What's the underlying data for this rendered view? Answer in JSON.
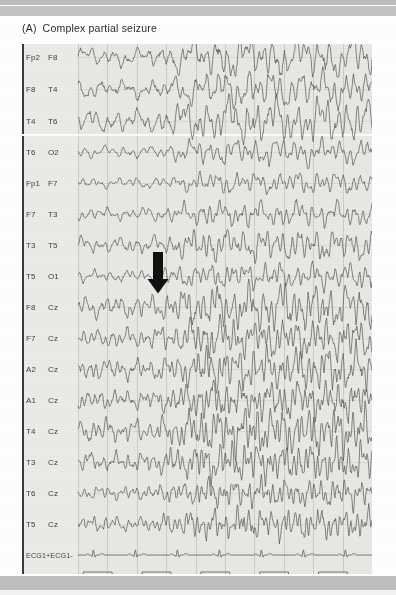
{
  "figure": {
    "panel_tag": "(A)",
    "title": "Complex partial seizure",
    "full_caption": "(A)  Complex partial seizure"
  },
  "annotation": {
    "arrow": {
      "name": "seizure-onset-arrow",
      "direction": "down",
      "color": "#111111",
      "x": 147,
      "y": 252,
      "points_at_channel": "T5 O1 / F8 Cz"
    }
  },
  "colors": {
    "plot_background": "#e9e7e4",
    "trace": "#4a4a4a",
    "axis": "#3a3a3a",
    "gridline": "#8c8c8c",
    "page_background": "#fefefe",
    "scan_band": "#bfbfbf",
    "arrow": "#111111"
  },
  "chart_data": {
    "type": "line",
    "xlabel": "",
    "ylabel": "",
    "grid": true,
    "legend": "none",
    "x": {
      "label": "time",
      "gridline_count": 10,
      "range_note": "continuous EEG epoch"
    },
    "channel_count": 18,
    "categories": [
      "Fp2 F8",
      "F8 T4",
      "T4 T6",
      "T6 O2",
      "Fp1 F7",
      "F7 T3",
      "T3 T5",
      "T5 O1",
      "F8 Cz",
      "F7 Cz",
      "A2 Cz",
      "A1 Cz",
      "T4 Cz",
      "T3 Cz",
      "T6 Cz",
      "T5 Cz",
      "ECG1+ ECG1-",
      "MKR+ MKR-"
    ],
    "series": [
      {
        "name": "Fp2 F8",
        "electrode_1": "Fp2",
        "electrode_2": "F8",
        "kind": "eeg",
        "row": 0,
        "baseline_y": 57,
        "amplitude": 11
      },
      {
        "name": "F8 T4",
        "electrode_1": "F8",
        "electrode_2": "T4",
        "kind": "eeg",
        "row": 1,
        "baseline_y": 89,
        "amplitude": 10
      },
      {
        "name": "T4 T6",
        "electrode_1": "T4",
        "electrode_2": "T6",
        "kind": "eeg",
        "row": 2,
        "baseline_y": 121,
        "amplitude": 12
      },
      {
        "name": "T6 O2",
        "electrode_1": "T6",
        "electrode_2": "O2",
        "kind": "eeg",
        "row": 3,
        "baseline_y": 152,
        "amplitude": 7
      },
      {
        "name": "Fp1 F7",
        "electrode_1": "Fp1",
        "electrode_2": "F7",
        "kind": "eeg",
        "row": 4,
        "baseline_y": 183,
        "amplitude": 6
      },
      {
        "name": "F7 T3",
        "electrode_1": "F7",
        "electrode_2": "T3",
        "kind": "eeg",
        "row": 5,
        "baseline_y": 214,
        "amplitude": 7
      },
      {
        "name": "T3 T5",
        "electrode_1": "T3",
        "electrode_2": "T5",
        "kind": "eeg",
        "row": 6,
        "baseline_y": 245,
        "amplitude": 9
      },
      {
        "name": "T5 O1",
        "electrode_1": "T5",
        "electrode_2": "O1",
        "kind": "eeg",
        "row": 7,
        "baseline_y": 276,
        "amplitude": 7
      },
      {
        "name": "F8 Cz",
        "electrode_1": "F8",
        "electrode_2": "Cz",
        "kind": "eeg",
        "row": 8,
        "baseline_y": 307,
        "amplitude": 13
      },
      {
        "name": "F7 Cz",
        "electrode_1": "F7",
        "electrode_2": "Cz",
        "kind": "eeg",
        "row": 9,
        "baseline_y": 338,
        "amplitude": 11
      },
      {
        "name": "A2 Cz",
        "electrode_1": "A2",
        "electrode_2": "Cz",
        "kind": "eeg",
        "row": 10,
        "baseline_y": 369,
        "amplitude": 12
      },
      {
        "name": "A1 Cz",
        "electrode_1": "A1",
        "electrode_2": "Cz",
        "kind": "eeg",
        "row": 11,
        "baseline_y": 400,
        "amplitude": 11
      },
      {
        "name": "T4 Cz",
        "electrode_1": "T4",
        "electrode_2": "Cz",
        "kind": "eeg",
        "row": 12,
        "baseline_y": 431,
        "amplitude": 13
      },
      {
        "name": "T3 Cz",
        "electrode_1": "T3",
        "electrode_2": "Cz",
        "kind": "eeg",
        "row": 13,
        "baseline_y": 462,
        "amplitude": 11
      },
      {
        "name": "T6 Cz",
        "electrode_1": "T6",
        "electrode_2": "Cz",
        "kind": "eeg",
        "row": 14,
        "baseline_y": 493,
        "amplitude": 8
      },
      {
        "name": "T5 Cz",
        "electrode_1": "T5",
        "electrode_2": "Cz",
        "kind": "eeg",
        "row": 15,
        "baseline_y": 524,
        "amplitude": 9
      },
      {
        "name": "ECG1+ ECG1-",
        "electrode_1": "ECG1+",
        "electrode_2": "ECG1-",
        "kind": "ecg",
        "row": 16,
        "baseline_y": 555,
        "amplitude": 6,
        "beats": 7
      },
      {
        "name": "MKR+ MKR-",
        "electrode_1": "MKR+",
        "electrode_2": "MKR-",
        "kind": "marker",
        "row": 17,
        "baseline_y": 586,
        "amplitude": 14,
        "waveform": "square",
        "pulses": 5
      }
    ],
    "montage_groups": [
      {
        "name": "right-temporal-chain",
        "channels": [
          "Fp2 F8",
          "F8 T4",
          "T4 T6"
        ]
      },
      {
        "name": "remaining-chains",
        "channels": [
          "T6 O2",
          "Fp1 F7",
          "F7 T3",
          "T3 T5",
          "T5 O1",
          "F8 Cz",
          "F7 Cz",
          "A2 Cz",
          "A1 Cz",
          "T4 Cz",
          "T3 Cz",
          "T6 Cz",
          "T5 Cz"
        ]
      }
    ]
  }
}
